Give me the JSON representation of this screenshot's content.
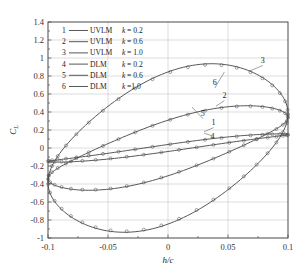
{
  "chart_data": {
    "type": "line",
    "title": "",
    "xlabel": "h/c",
    "ylabel": "C_L",
    "xlim": [
      -0.1,
      0.1
    ],
    "ylim": [
      -1.0,
      1.4
    ],
    "xticks": [
      "-0.1",
      "-0.05",
      "0",
      "0.05",
      "0.1"
    ],
    "xtick_values": [
      -0.1,
      -0.05,
      0,
      0.05,
      0.1
    ],
    "yticks": [
      "1.4",
      "1.2",
      "1",
      "0.8",
      "0.6",
      "0.4",
      "0.2",
      "0",
      "-0.2",
      "-0.4",
      "-0.6",
      "-0.8",
      "-1"
    ],
    "ytick_values": [
      1.4,
      1.2,
      1.0,
      0.8,
      0.6,
      0.4,
      0.2,
      0,
      -0.2,
      -0.4,
      -0.6,
      -0.8,
      -1.0
    ],
    "grid": true,
    "legend_position": "upper-left",
    "series": [
      {
        "id": "1",
        "name": "UVLM  k= 0.2",
        "method": "UVLM",
        "k": 0.2,
        "style": "line",
        "upper_amplitude": 0.175,
        "lower_amplitude": -0.175,
        "loop_width": 0.02
      },
      {
        "id": "2",
        "name": "UVLM  k= 0.6",
        "method": "UVLM",
        "k": 0.6,
        "style": "line",
        "upper_amplitude": 0.46,
        "lower_amplitude": -0.475,
        "loop_width": 0.07
      },
      {
        "id": "3",
        "name": "UVLM  k= 1.0",
        "method": "UVLM",
        "k": 1.0,
        "style": "line",
        "upper_amplitude": 0.86,
        "lower_amplitude": -0.87,
        "loop_width": 0.14
      },
      {
        "id": "4",
        "name": "DLM    k= 0.2",
        "method": "DLM",
        "k": 0.2,
        "style": "circles",
        "upper_amplitude": 0.17,
        "lower_amplitude": -0.17,
        "loop_width": 0.02
      },
      {
        "id": "5",
        "name": "DLM    k= 0.6",
        "method": "DLM",
        "k": 0.6,
        "style": "circles",
        "upper_amplitude": 0.455,
        "lower_amplitude": -0.47,
        "loop_width": 0.07
      },
      {
        "id": "6",
        "name": "DLM    k=1.0",
        "method": "DLM",
        "k": 1.0,
        "style": "circles",
        "upper_amplitude": 0.85,
        "lower_amplitude": -0.86,
        "loop_width": 0.14
      }
    ],
    "annotations": [
      {
        "label": "1",
        "x": 0.038,
        "y": 0.26
      },
      {
        "label": "2",
        "x": 0.047,
        "y": 0.56
      },
      {
        "label": "3",
        "x": 0.079,
        "y": 0.95
      },
      {
        "label": "4",
        "x": 0.037,
        "y": 0.1
      },
      {
        "label": "5",
        "x": 0.029,
        "y": 0.36
      },
      {
        "label": "6",
        "x": 0.039,
        "y": 0.7
      }
    ]
  },
  "legend": {
    "rows": [
      {
        "num": "1",
        "method": "UVLM",
        "k": "k",
        "kval": "= 0.2"
      },
      {
        "num": "2",
        "method": "UVLM",
        "k": "k",
        "kval": "= 0.6"
      },
      {
        "num": "3",
        "method": "UVLM",
        "k": "k",
        "kval": "= 1.0"
      },
      {
        "num": "4",
        "method": "DLM",
        "k": "k",
        "kval": "= 0.2"
      },
      {
        "num": "5",
        "method": "DLM",
        "k": "k",
        "kval": "= 0.6"
      },
      {
        "num": "6",
        "method": "DLM",
        "k": "k",
        "kval": "=1.0"
      }
    ]
  },
  "colors": {
    "line": "#3a3a3a",
    "marker": "#555555",
    "grid": "#b9b9b9",
    "frame": "#4a4a4a"
  }
}
